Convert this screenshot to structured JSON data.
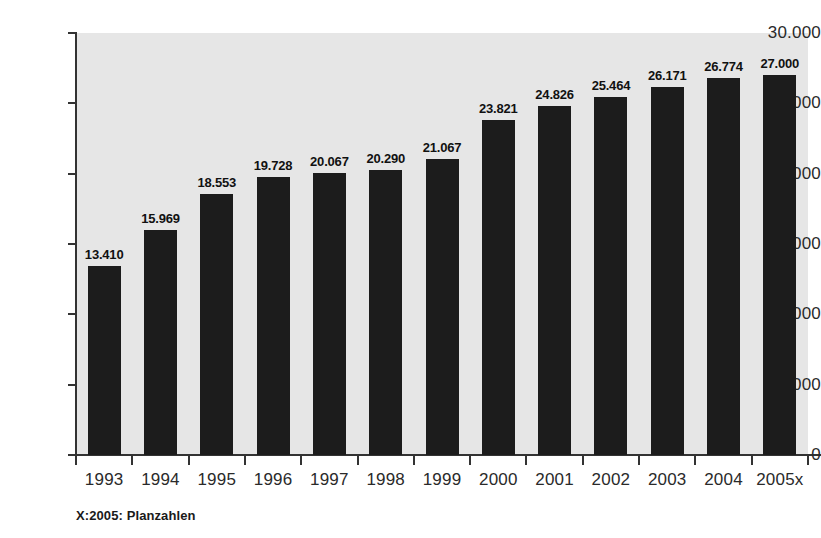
{
  "chart_data": {
    "type": "bar",
    "title": "",
    "xlabel": "",
    "ylabel": "",
    "categories": [
      "1993",
      "1994",
      "1995",
      "1996",
      "1997",
      "1998",
      "1999",
      "2000",
      "2001",
      "2002",
      "2003",
      "2004",
      "2005x"
    ],
    "values": [
      13410,
      15969,
      18553,
      19728,
      20067,
      20290,
      21067,
      23821,
      24826,
      25464,
      26171,
      26774,
      27000
    ],
    "value_labels": [
      "13.410",
      "15.969",
      "18.553",
      "19.728",
      "20.067",
      "20.290",
      "21.067",
      "23.821",
      "24.826",
      "25.464",
      "26.171",
      "26.774",
      "27.000"
    ],
    "ylim": [
      0,
      30000
    ],
    "ytick_values": [
      0,
      5000,
      10000,
      15000,
      20000,
      25000,
      30000
    ],
    "ytick_labels": [
      "0",
      "5.000",
      "10.000",
      "15.000",
      "20.000",
      "25.000",
      "30.000"
    ],
    "grid": false,
    "legend": null,
    "annotations": [
      "X:2005: Planzahlen"
    ],
    "number_format": "de-DE (period as thousands separator)",
    "colors": {
      "bar": "#1c1c1c",
      "plot_background": "#e6e6e6",
      "figure_background": "#ffffff",
      "axis": "#333333",
      "text": "#2a2a2a"
    }
  },
  "footnote": {
    "text": "X:2005: Planzahlen"
  }
}
